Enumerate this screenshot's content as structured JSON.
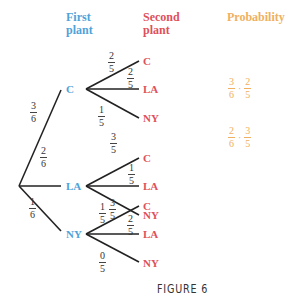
{
  "headers": {
    "first_plant": [
      "First",
      "plant"
    ],
    "second_plant": [
      "Second",
      "plant"
    ],
    "probability": "Probability"
  },
  "root_branches": [
    {
      "label": "C",
      "num": "3",
      "den": "6"
    },
    {
      "label": "LA",
      "num": "2",
      "den": "6"
    },
    {
      "label": "NY",
      "num": "1",
      "den": "6"
    }
  ],
  "second_branches": {
    "C": [
      {
        "label": "C",
        "num": "2",
        "den": "5"
      },
      {
        "label": "LA",
        "num": "2",
        "den": "5"
      },
      {
        "label": "NY",
        "num": "1",
        "den": "5"
      }
    ],
    "LA": [
      {
        "label": "C",
        "num": "3",
        "den": "5"
      },
      {
        "label": "LA",
        "num": "1",
        "den": "5"
      },
      {
        "label": "NY",
        "num": "1",
        "den": "5"
      }
    ],
    "NY": [
      {
        "label": "C",
        "num": "3",
        "den": "5"
      },
      {
        "label": "LA",
        "num": "2",
        "den": "5"
      },
      {
        "label": "NY",
        "num": "0",
        "den": "5"
      }
    ]
  },
  "probabilities": [
    {
      "row": "C-LA",
      "a_num": "3",
      "a_den": "6",
      "op": "·",
      "b_num": "2",
      "b_den": "5"
    },
    {
      "row": "LA-C",
      "a_num": "2",
      "a_den": "6",
      "op": "·",
      "b_num": "3",
      "b_den": "5"
    }
  ],
  "caption": "FIGURE 6",
  "colors": {
    "first_plant": "#4fa3d9",
    "second_plant": "#e0505a",
    "probability": "#f0b060",
    "lines": "#222222"
  }
}
